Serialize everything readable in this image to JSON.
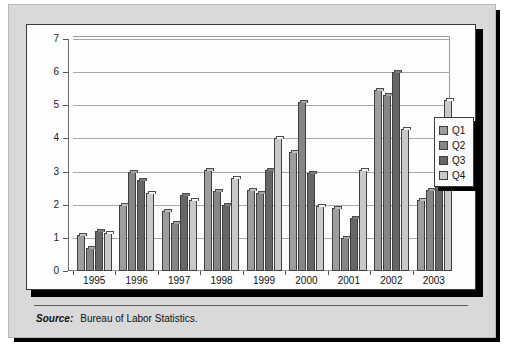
{
  "footer": {
    "source_label": "Source:",
    "source_text": "Bureau of Labor Statistics."
  },
  "legend": {
    "position": "right-outside",
    "entries": [
      {
        "label": "Q1",
        "color": "#9d9d9d"
      },
      {
        "label": "Q2",
        "color": "#868686"
      },
      {
        "label": "Q3",
        "color": "#666666"
      },
      {
        "label": "Q4",
        "color": "#c9c9c9"
      }
    ]
  },
  "chart_data": {
    "type": "bar",
    "title": "",
    "xlabel": "",
    "ylabel": "",
    "ylim": [
      0,
      7
    ],
    "yticks": [
      0,
      1,
      2,
      3,
      4,
      5,
      6,
      7
    ],
    "ytick_labels": [
      "0",
      "1",
      "2",
      "3",
      "4",
      "5",
      "6",
      "7"
    ],
    "grid": true,
    "grid_axis": "y",
    "legend_position": "right",
    "categories": [
      "1995",
      "1996",
      "1997",
      "1998",
      "1999",
      "2000",
      "2001",
      "2002",
      "2003"
    ],
    "series": [
      {
        "name": "Q1",
        "color": "#9d9d9d",
        "values": [
          1.1,
          2.0,
          1.8,
          3.05,
          2.45,
          3.6,
          1.9,
          5.45,
          2.15
        ]
      },
      {
        "name": "Q2",
        "color": "#868686",
        "values": [
          0.7,
          3.0,
          1.45,
          2.4,
          2.35,
          5.1,
          1.0,
          5.3,
          2.45
        ]
      },
      {
        "name": "Q3",
        "color": "#666666",
        "values": [
          1.2,
          2.75,
          2.3,
          2.0,
          3.05,
          2.95,
          1.6,
          6.0,
          4.0
        ]
      },
      {
        "name": "Q4",
        "color": "#c9c9c9",
        "values": [
          1.15,
          2.35,
          2.15,
          2.8,
          4.0,
          1.95,
          3.05,
          4.3,
          5.15
        ]
      }
    ]
  }
}
